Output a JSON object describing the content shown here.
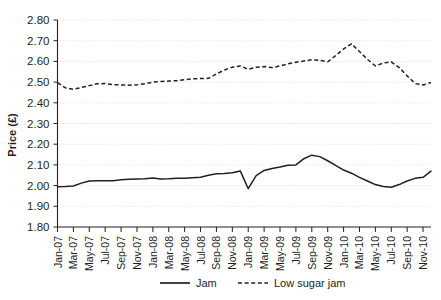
{
  "chart_data": {
    "type": "line",
    "title": "",
    "xlabel": "",
    "ylabel": "Price (£)",
    "ylim": [
      1.8,
      2.8
    ],
    "ytick_step": 0.1,
    "ytick_labels": [
      "2.80",
      "2.70",
      "2.60",
      "2.50",
      "2.40",
      "2.30",
      "2.20",
      "2.10",
      "2.00",
      "1.90",
      "1.80"
    ],
    "ytick_values": [
      2.8,
      2.7,
      2.6,
      2.5,
      2.4,
      2.3,
      2.2,
      2.1,
      2.0,
      1.9,
      1.8
    ],
    "grid": true,
    "grid_axis": "y",
    "legend_position": "bottom",
    "x": [
      "Jan-07",
      "Feb-07",
      "Mar-07",
      "Apr-07",
      "May-07",
      "Jun-07",
      "Jul-07",
      "Aug-07",
      "Sep-07",
      "Oct-07",
      "Nov-07",
      "Dec-07",
      "Jan-08",
      "Feb-08",
      "Mar-08",
      "Apr-08",
      "May-08",
      "Jun-08",
      "Jul-08",
      "Aug-08",
      "Sep-08",
      "Oct-08",
      "Nov-08",
      "Dec-08",
      "Jan-09",
      "Feb-09",
      "Mar-09",
      "Apr-09",
      "May-09",
      "Jun-09",
      "Jul-09",
      "Aug-09",
      "Sep-09",
      "Oct-09",
      "Nov-09",
      "Dec-09",
      "Jan-10",
      "Feb-10",
      "Mar-10",
      "Apr-10",
      "May-10",
      "Jun-10",
      "Jul-10",
      "Aug-10",
      "Sep-10",
      "Oct-10",
      "Nov-10",
      "Dec-10"
    ],
    "xtick_labels": [
      "Jan-07",
      "Mar-07",
      "May-07",
      "Jul-07",
      "Sep-07",
      "Nov-07",
      "Jan-08",
      "Mar-08",
      "May-08",
      "Jul-08",
      "Sep-08",
      "Nov-08",
      "Jan-09",
      "Mar-09",
      "May-09",
      "Jul-09",
      "Sep-09",
      "Nov-09",
      "Jan-10",
      "Mar-10",
      "May-10",
      "Jul-10",
      "Sep-10",
      "Nov-10"
    ],
    "xtick_indices": [
      0,
      2,
      4,
      6,
      8,
      10,
      12,
      14,
      16,
      18,
      20,
      22,
      24,
      26,
      28,
      30,
      32,
      34,
      36,
      38,
      40,
      42,
      44,
      46
    ],
    "series": [
      {
        "name": "Jam",
        "style": "solid",
        "color": "#231f20",
        "values": [
          1.995,
          1.996,
          1.998,
          2.012,
          2.022,
          2.023,
          2.023,
          2.024,
          2.028,
          2.031,
          2.032,
          2.033,
          2.037,
          2.032,
          2.033,
          2.036,
          2.036,
          2.038,
          2.04,
          2.05,
          2.057,
          2.058,
          2.062,
          2.071,
          1.985,
          2.048,
          2.073,
          2.083,
          2.09,
          2.098,
          2.1,
          2.13,
          2.147,
          2.14,
          2.12,
          2.098,
          2.075,
          2.06,
          2.04,
          2.022,
          2.005,
          1.996,
          1.992,
          2.005,
          2.022,
          2.035,
          2.04,
          2.07
        ]
      },
      {
        "name": "Low sugar jam",
        "style": "dashed",
        "color": "#231f20",
        "values": [
          2.497,
          2.472,
          2.465,
          2.474,
          2.483,
          2.492,
          2.493,
          2.488,
          2.486,
          2.485,
          2.487,
          2.492,
          2.5,
          2.503,
          2.505,
          2.507,
          2.512,
          2.516,
          2.517,
          2.518,
          2.54,
          2.558,
          2.572,
          2.578,
          2.562,
          2.572,
          2.575,
          2.57,
          2.578,
          2.588,
          2.596,
          2.602,
          2.608,
          2.605,
          2.598,
          2.628,
          2.66,
          2.685,
          2.648,
          2.61,
          2.578,
          2.592,
          2.598,
          2.57,
          2.53,
          2.493,
          2.486,
          2.498
        ]
      }
    ],
    "jam_extra_tail": [
      2.505,
      2.512,
      2.538,
      2.555,
      2.54,
      2.512,
      2.485,
      2.498,
      2.52,
      2.555,
      2.528
    ],
    "annotations": []
  },
  "legend": {
    "items": [
      {
        "label": "Jam",
        "style": "solid"
      },
      {
        "label": "Low sugar jam",
        "style": "dashed"
      }
    ]
  },
  "axes": {
    "y_title": "Price (£)"
  }
}
